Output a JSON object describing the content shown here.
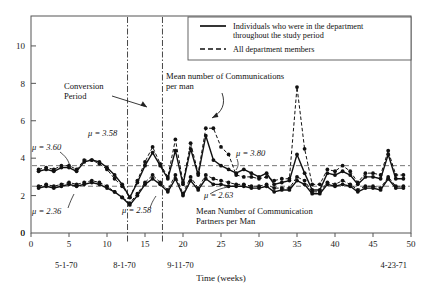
{
  "chart_data": {
    "type": "line",
    "title": "",
    "xlabel": "Time (weeks)",
    "ylabel": "",
    "xlim": [
      0,
      50
    ],
    "ylim": [
      0,
      11.6
    ],
    "xticks": [
      0,
      5,
      10,
      15,
      20,
      25,
      30,
      35,
      40,
      45,
      50
    ],
    "yticks": [
      0,
      2,
      4,
      6,
      8,
      10
    ],
    "grid": false,
    "legend_position": "top-right",
    "legend": [
      {
        "style": "solid",
        "label": "Individuals who were in the department throughout the study period"
      },
      {
        "style": "dashed",
        "label": "All department members"
      }
    ],
    "annotations": [
      {
        "name": "conversion-period",
        "text": "Conversion\nPeriod",
        "x": 4.5,
        "y": 8.0
      },
      {
        "name": "communications-per-man",
        "text": "Mean number of Communications\nper man",
        "x": 18.0,
        "y": 8.6
      },
      {
        "name": "partners-per-man",
        "text": "Mean Number of Communication\nPartners per Man",
        "x": 24.0,
        "y": 1.35
      }
    ],
    "mean_labels": [
      {
        "name": "mu-3-60",
        "text": "μ = 3.60",
        "value": 3.6,
        "period": "pre",
        "series": "communications"
      },
      {
        "name": "mu-2-36",
        "text": "μ = 2.36",
        "value": 2.36,
        "period": "pre",
        "series": "partners"
      },
      {
        "name": "mu-3-58",
        "text": "μ = 3.58",
        "value": 3.58,
        "period": "conversion",
        "series": "communications"
      },
      {
        "name": "mu-2-58",
        "text": "μ = 2.58",
        "value": 2.58,
        "period": "conversion",
        "series": "partners"
      },
      {
        "name": "mu-3-80",
        "text": "μ = 3.80",
        "value": 3.8,
        "period": "post",
        "series": "communications"
      },
      {
        "name": "mu-2-63",
        "text": "μ = 2.63",
        "value": 2.63,
        "period": "post",
        "series": "partners"
      }
    ],
    "reference_lines_h": [
      {
        "name": "ref-line-3-6",
        "value": 3.6,
        "style": "dashed"
      },
      {
        "name": "ref-line-2-5",
        "value": 2.5,
        "style": "dashed"
      }
    ],
    "reference_lines_v": [
      {
        "name": "conversion-start-line",
        "x": 12.7,
        "style": "dash-dot"
      },
      {
        "name": "conversion-end-line",
        "x": 17.3,
        "style": "dash-dot"
      }
    ],
    "date_axis": [
      {
        "name": "date-start",
        "text": "5-1-70",
        "x": 0
      },
      {
        "name": "date-conversion-start",
        "text": "8-1-70",
        "x": 12.7
      },
      {
        "name": "date-conversion-end",
        "text": "9-11-70",
        "x": 17.3
      },
      {
        "name": "date-end",
        "text": "4-23-71",
        "x": 50
      }
    ],
    "series": [
      {
        "name": "communications-core-members",
        "style": "solid",
        "marker": "filled-circle",
        "x": [
          1,
          2,
          3,
          4,
          5,
          6,
          7,
          8,
          9,
          10,
          11,
          12,
          13,
          14,
          15,
          16,
          17,
          18,
          19,
          20,
          21,
          22,
          23,
          24,
          25,
          26,
          27,
          28,
          29,
          30,
          31,
          32,
          33,
          34,
          35,
          36,
          37,
          38,
          39,
          40,
          41,
          42,
          43,
          44,
          45,
          46,
          47,
          48,
          49
        ],
        "values": [
          3.3,
          3.4,
          3.3,
          3.5,
          3.5,
          3.3,
          3.8,
          3.9,
          3.8,
          3.5,
          3.1,
          2.6,
          1.9,
          2.7,
          3.6,
          4.3,
          3.6,
          2.9,
          4.4,
          2.6,
          4.5,
          3.1,
          5.2,
          3.9,
          3.6,
          3.4,
          3.2,
          3.4,
          3.2,
          3.0,
          3.2,
          2.6,
          2.7,
          2.8,
          4.2,
          3.2,
          2.3,
          2.3,
          3.2,
          3.1,
          3.3,
          3.1,
          2.6,
          3.0,
          3.0,
          2.9,
          4.2,
          2.9,
          2.9
        ]
      },
      {
        "name": "communications-all-members",
        "style": "dashed",
        "marker": "filled-circle",
        "x": [
          1,
          2,
          3,
          4,
          5,
          6,
          7,
          8,
          9,
          10,
          11,
          12,
          13,
          14,
          15,
          16,
          17,
          18,
          19,
          20,
          21,
          22,
          23,
          24,
          25,
          26,
          27,
          28,
          29,
          30,
          31,
          32,
          33,
          34,
          35,
          36,
          37,
          38,
          39,
          40,
          41,
          42,
          43,
          44,
          45,
          46,
          47,
          48,
          49
        ],
        "values": [
          3.4,
          3.5,
          3.4,
          3.6,
          3.6,
          3.4,
          3.9,
          3.9,
          3.7,
          3.4,
          2.9,
          2.5,
          1.9,
          2.8,
          3.8,
          4.6,
          3.7,
          3.0,
          5.0,
          2.7,
          4.8,
          3.2,
          5.6,
          5.6,
          4.6,
          4.2,
          3.1,
          3.0,
          3.0,
          2.9,
          3.0,
          2.8,
          2.9,
          2.9,
          7.8,
          4.5,
          2.6,
          2.6,
          3.4,
          3.3,
          3.6,
          3.3,
          2.7,
          3.2,
          3.2,
          3.1,
          4.4,
          3.1,
          3.1
        ]
      },
      {
        "name": "partners-core-members",
        "style": "solid",
        "marker": "filled-circle",
        "x": [
          1,
          2,
          3,
          4,
          5,
          6,
          7,
          8,
          9,
          10,
          11,
          12,
          13,
          14,
          15,
          16,
          17,
          18,
          19,
          20,
          21,
          22,
          23,
          24,
          25,
          26,
          27,
          28,
          29,
          30,
          31,
          32,
          33,
          34,
          35,
          36,
          37,
          38,
          39,
          40,
          41,
          42,
          43,
          44,
          45,
          46,
          47,
          48,
          49
        ],
        "values": [
          2.4,
          2.5,
          2.4,
          2.5,
          2.6,
          2.5,
          2.6,
          2.7,
          2.6,
          2.4,
          2.2,
          1.9,
          1.5,
          2.0,
          2.6,
          2.9,
          2.6,
          2.2,
          2.9,
          2.0,
          2.8,
          2.3,
          2.9,
          2.6,
          2.6,
          2.5,
          2.5,
          2.5,
          2.4,
          2.4,
          2.5,
          2.2,
          2.3,
          2.3,
          2.8,
          2.6,
          2.1,
          2.1,
          2.6,
          2.5,
          2.6,
          2.5,
          2.2,
          2.4,
          2.4,
          2.3,
          2.9,
          2.4,
          2.4
        ]
      },
      {
        "name": "partners-all-members",
        "style": "dashed",
        "marker": "filled-circle",
        "x": [
          1,
          2,
          3,
          4,
          5,
          6,
          7,
          8,
          9,
          10,
          11,
          12,
          13,
          14,
          15,
          16,
          17,
          18,
          19,
          20,
          21,
          22,
          23,
          24,
          25,
          26,
          27,
          28,
          29,
          30,
          31,
          32,
          33,
          34,
          35,
          36,
          37,
          38,
          39,
          40,
          41,
          42,
          43,
          44,
          45,
          46,
          47,
          48,
          49
        ],
        "values": [
          2.5,
          2.6,
          2.5,
          2.6,
          2.7,
          2.6,
          2.7,
          2.8,
          2.7,
          2.5,
          2.2,
          1.9,
          1.6,
          2.1,
          2.7,
          3.1,
          2.7,
          2.3,
          3.1,
          2.1,
          3.0,
          2.4,
          3.1,
          2.9,
          2.8,
          2.7,
          2.6,
          2.6,
          2.5,
          2.5,
          2.6,
          2.4,
          2.4,
          2.4,
          3.0,
          2.8,
          2.2,
          2.2,
          2.7,
          2.6,
          2.8,
          2.6,
          2.3,
          2.5,
          2.5,
          2.4,
          3.0,
          2.5,
          2.5
        ]
      }
    ]
  },
  "colors": {
    "ink": "#111111",
    "axis": "#555555",
    "dashed_ref": "#666666"
  }
}
